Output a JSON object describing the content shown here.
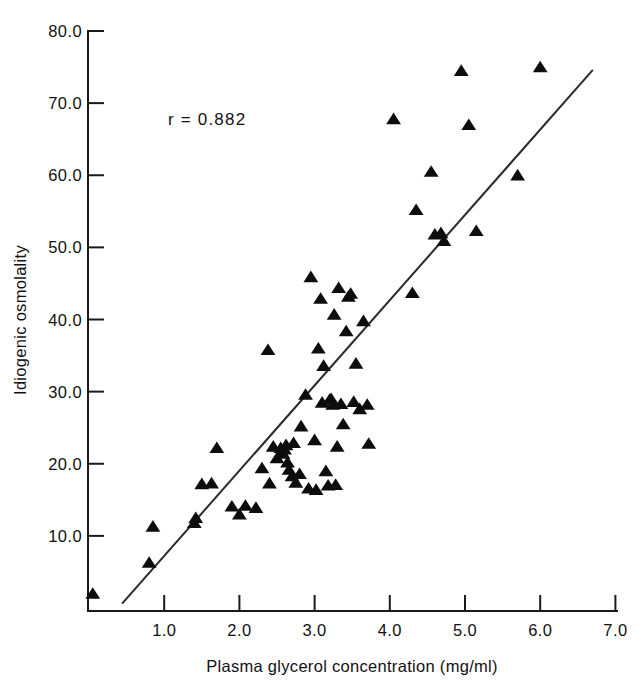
{
  "chart_data": {
    "type": "scatter",
    "title": "",
    "xlabel": "Plasma glycerol concentration (mg/ml)",
    "ylabel": "Idiogenic osmolality",
    "xlim": [
      0.0,
      7.0
    ],
    "ylim": [
      0.0,
      80.0
    ],
    "xticks": [
      "1.0",
      "2.0",
      "3.0",
      "4.0",
      "5.0",
      "6.0",
      "7.0"
    ],
    "xtick_values": [
      1.0,
      2.0,
      3.0,
      4.0,
      5.0,
      6.0,
      7.0
    ],
    "yticks": [
      "10.0",
      "20.0",
      "30.0",
      "40.0",
      "50.0",
      "60.0",
      "70.0",
      "80.0"
    ],
    "ytick_values": [
      10.0,
      20.0,
      30.0,
      40.0,
      50.0,
      60.0,
      70.0,
      80.0
    ],
    "grid": false,
    "legend": false,
    "marker": "triangle-up",
    "marker_color": "#0d0d0d",
    "annotations": [
      {
        "name": "correlation",
        "text": "r = 0.882",
        "x": 1.05,
        "y": 67.0
      }
    ],
    "series": [
      {
        "name": "Observations",
        "marker": "triangle-up",
        "points": [
          [
            0.05,
            2.0
          ],
          [
            0.8,
            6.3
          ],
          [
            0.85,
            11.3
          ],
          [
            1.4,
            11.8
          ],
          [
            1.42,
            12.5
          ],
          [
            1.5,
            17.2
          ],
          [
            1.63,
            17.3
          ],
          [
            1.7,
            22.2
          ],
          [
            1.9,
            14.1
          ],
          [
            2.0,
            13.0
          ],
          [
            2.08,
            14.2
          ],
          [
            2.22,
            13.9
          ],
          [
            2.3,
            19.4
          ],
          [
            2.38,
            35.8
          ],
          [
            2.4,
            17.3
          ],
          [
            2.45,
            22.4
          ],
          [
            2.5,
            20.8
          ],
          [
            2.55,
            22.2
          ],
          [
            2.58,
            21.4
          ],
          [
            2.6,
            22.0
          ],
          [
            2.62,
            22.6
          ],
          [
            2.64,
            20.2
          ],
          [
            2.66,
            19.2
          ],
          [
            2.7,
            18.3
          ],
          [
            2.72,
            22.9
          ],
          [
            2.75,
            17.4
          ],
          [
            2.8,
            18.6
          ],
          [
            2.82,
            25.2
          ],
          [
            2.88,
            29.6
          ],
          [
            2.92,
            16.6
          ],
          [
            2.95,
            45.9
          ],
          [
            3.0,
            23.3
          ],
          [
            3.02,
            16.4
          ],
          [
            3.05,
            36.0
          ],
          [
            3.08,
            42.9
          ],
          [
            3.1,
            28.5
          ],
          [
            3.12,
            33.6
          ],
          [
            3.15,
            19.0
          ],
          [
            3.18,
            17.0
          ],
          [
            3.2,
            28.9
          ],
          [
            3.22,
            29.0
          ],
          [
            3.24,
            28.2
          ],
          [
            3.26,
            40.7
          ],
          [
            3.28,
            17.1
          ],
          [
            3.3,
            22.4
          ],
          [
            3.32,
            44.4
          ],
          [
            3.35,
            28.3
          ],
          [
            3.38,
            25.5
          ],
          [
            3.42,
            38.4
          ],
          [
            3.45,
            43.2
          ],
          [
            3.48,
            43.6
          ],
          [
            3.52,
            28.6
          ],
          [
            3.55,
            33.9
          ],
          [
            3.6,
            27.6
          ],
          [
            3.65,
            39.8
          ],
          [
            3.7,
            28.2
          ],
          [
            3.72,
            22.8
          ],
          [
            4.05,
            67.8
          ],
          [
            4.3,
            43.7
          ],
          [
            4.35,
            55.2
          ],
          [
            4.55,
            60.5
          ],
          [
            4.6,
            51.8
          ],
          [
            4.68,
            52.0
          ],
          [
            4.72,
            50.9
          ],
          [
            4.95,
            74.5
          ],
          [
            5.05,
            67.0
          ],
          [
            5.15,
            52.3
          ],
          [
            5.7,
            60.0
          ],
          [
            6.0,
            75.0
          ]
        ]
      }
    ],
    "fit_line": {
      "name": "regression-line",
      "x_start": 0.44,
      "y_start": 0.6,
      "x_end": 6.7,
      "y_end": 74.6
    }
  }
}
